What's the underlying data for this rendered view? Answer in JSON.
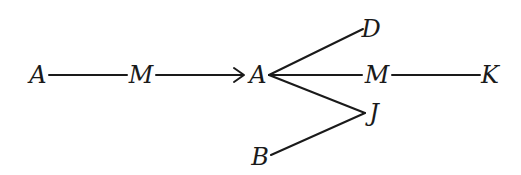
{
  "diagram": {
    "type": "graph",
    "stroke_color": "#1a1a1a",
    "background": "#ffffff",
    "nodes": [
      {
        "id": "A1",
        "label": "A",
        "x": 38,
        "y": 75
      },
      {
        "id": "M1",
        "label": "M",
        "x": 141,
        "y": 75
      },
      {
        "id": "A2",
        "label": "A",
        "x": 258,
        "y": 75
      },
      {
        "id": "D",
        "label": "D",
        "x": 371,
        "y": 29
      },
      {
        "id": "M2",
        "label": "M",
        "x": 377,
        "y": 75
      },
      {
        "id": "K",
        "label": "K",
        "x": 490,
        "y": 75
      },
      {
        "id": "J",
        "label": "J",
        "x": 374,
        "y": 113
      },
      {
        "id": "B",
        "label": "B",
        "x": 260,
        "y": 157
      }
    ],
    "edges": [
      {
        "from": "A1",
        "to": "M1",
        "directed": false
      },
      {
        "from": "M1",
        "to": "A2",
        "directed": true
      },
      {
        "from": "A2",
        "to": "D",
        "directed": false
      },
      {
        "from": "A2",
        "to": "M2",
        "directed": false
      },
      {
        "from": "M2",
        "to": "K",
        "directed": false
      },
      {
        "from": "A2",
        "to": "J",
        "directed": false
      },
      {
        "from": "B",
        "to": "J",
        "directed": false
      }
    ]
  }
}
